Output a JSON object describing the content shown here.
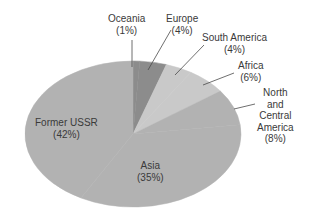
{
  "chart_data": {
    "type": "pie",
    "title": "",
    "start_angle_deg": 0,
    "direction": "clockwise",
    "categories": [
      "Oceania",
      "Europe",
      "South America",
      "Africa",
      "North and Central America",
      "Asia",
      "Former USSR"
    ],
    "values": [
      1,
      4,
      4,
      6,
      8,
      35,
      42
    ],
    "unit": "%",
    "colors": [
      "#8c8c8c",
      "#8c8c8c",
      "#c9c9c9",
      "#c9c9c9",
      "#b2b2b2",
      "#b2b2b2",
      "#b2b2b2"
    ],
    "labels": [
      {
        "name": "Oceania",
        "pct": "(1%)"
      },
      {
        "name": "Europe",
        "pct": "(4%)"
      },
      {
        "name": "South America",
        "pct": "(4%)"
      },
      {
        "name": "Africa",
        "pct": "(6%)"
      },
      {
        "name": "North\nand\nCentral\nAmerica",
        "pct": "(8%)"
      },
      {
        "name": "Asia",
        "pct": "(35%)"
      },
      {
        "name": "Former USSR",
        "pct": "(42%)"
      }
    ],
    "legend": "none (direct labels)"
  },
  "labels": {
    "oceania": {
      "l1": "Oceania",
      "l2": "(1%)"
    },
    "europe": {
      "l1": "Europe",
      "l2": "(4%)"
    },
    "south_america": {
      "l1": "South America",
      "l2": "(4%)"
    },
    "africa": {
      "l1": "Africa",
      "l2": "(6%)"
    },
    "north_central_america": {
      "l1": "North",
      "l2": "and",
      "l3": "Central",
      "l4": "America",
      "l5": "(8%)"
    },
    "asia": {
      "l1": "Asia",
      "l2": "(35%)"
    },
    "former_ussr": {
      "l1": "Former USSR",
      "l2": "(42%)"
    }
  }
}
